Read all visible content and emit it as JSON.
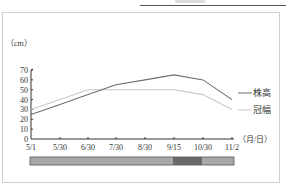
{
  "chart_data": {
    "type": "line",
    "title": "",
    "ylabel": "（cm）",
    "xlabel": "（月/日）",
    "ylim": [
      0,
      70
    ],
    "yticks": [
      0,
      10,
      20,
      30,
      40,
      50,
      60,
      70
    ],
    "categories": [
      "5/1",
      "5/30",
      "6/30",
      "7/30",
      "8/30",
      "9/15",
      "10/30",
      "11/2"
    ],
    "series": [
      {
        "name": "株高",
        "color": "#6e6e6e",
        "values": [
          25,
          35,
          45,
          55,
          60,
          65,
          60,
          40
        ]
      },
      {
        "name": "冠幅",
        "color": "#c8c8c8",
        "values": [
          30,
          40,
          50,
          50,
          50,
          50,
          45,
          30
        ]
      }
    ],
    "legend_position": "right",
    "grid": false,
    "timeline_bar": {
      "segments": [
        {
          "from": "5/1",
          "to": "9/15",
          "color": "#a8a8a8"
        },
        {
          "from": "9/15",
          "to": "10/30",
          "color": "#6a6a6a"
        },
        {
          "from": "10/30",
          "to": "11/2",
          "color": "#a8a8a8"
        }
      ]
    }
  },
  "legend": {
    "plant_height": "株高",
    "crown_width": "冠幅"
  },
  "axis": {
    "y_unit": "（cm）",
    "x_unit": "（月/日）"
  }
}
